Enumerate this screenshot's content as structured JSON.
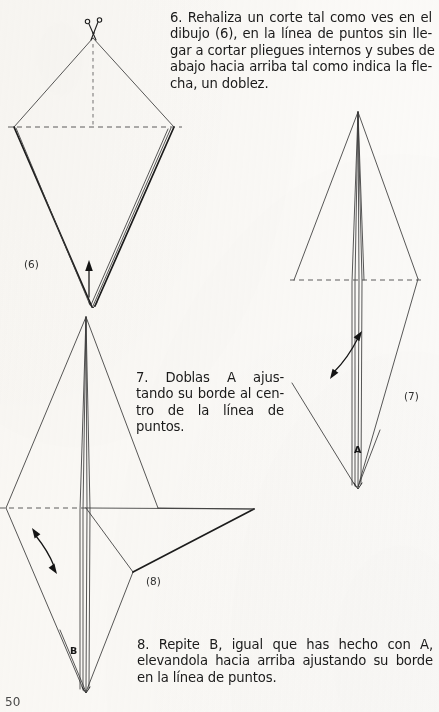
{
  "page": {
    "background_color": "#fbfaf8",
    "ink_color": "#2b2b2b",
    "page_number": "50",
    "width": 439,
    "height": 712
  },
  "instructions": [
    {
      "id": "step-6",
      "number": "6.",
      "lines": [
        "6. Rehaliza un corte tal como ves en el",
        "dibujo (6), en la línea de puntos sin lle-",
        "gar a cortar pliegues internos y subes de",
        "abajo hacia arriba tal como indica la fle-",
        "cha, un doblez."
      ],
      "full_text": "6. Rehaliza un corte tal como ves en el dibujo (6), en la línea de puntos sin llegar a cortar pliegues internos y subes de abajo hacia arriba tal como indica la flecha, un doblez."
    },
    {
      "id": "step-7",
      "number": "7.",
      "lines": [
        "7. Doblas A ajus-",
        "tando su borde al cen-",
        "tro de la línea de",
        "puntos."
      ],
      "full_text": "7. Doblas A ajustando su borde al centro de la línea de puntos."
    },
    {
      "id": "step-8",
      "number": "8.",
      "lines": [
        "8. Repite B, igual que has hecho con A,",
        "elevandola hacia arriba ajustando su borde",
        "en la línea de puntos."
      ],
      "full_text": "8. Repite B, igual que has hecho con A, elevandola hacia arriba ajustando su borde en la línea de puntos."
    }
  ],
  "figures": [
    {
      "id": "figure-6",
      "label": "(6)",
      "icons": [
        "scissors-icon",
        "up-arrow-icon"
      ],
      "fold_line": "dashed-horizontal",
      "description": "Kite shape with scissors cutting at top apex and an upward arrow at the bottom point"
    },
    {
      "id": "figure-7",
      "label": "(7)",
      "point_labels": [
        "A"
      ],
      "icons": [
        "double-curved-arrow-icon"
      ],
      "fold_line": "dashed-horizontal",
      "description": "Tall narrow kite with flap A at lower point and a double headed curved arrow"
    },
    {
      "id": "figure-8",
      "label": "(8)",
      "point_labels": [
        "B"
      ],
      "icons": [
        "double-curved-arrow-icon"
      ],
      "fold_line": "dashed-horizontal",
      "description": "Kite with a folded out flap to the right, flap B at the lower point and a double headed curved arrow"
    }
  ]
}
